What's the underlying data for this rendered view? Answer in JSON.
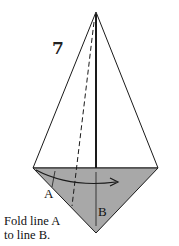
{
  "step": {
    "number": "7"
  },
  "labels": {
    "a": "A",
    "b": "B"
  },
  "caption": {
    "line1": "Fold line A",
    "line2": "to line B."
  },
  "colors": {
    "shaded": "#a8a8a8",
    "stroke": "#1a1a1a",
    "background": "#ffffff"
  }
}
